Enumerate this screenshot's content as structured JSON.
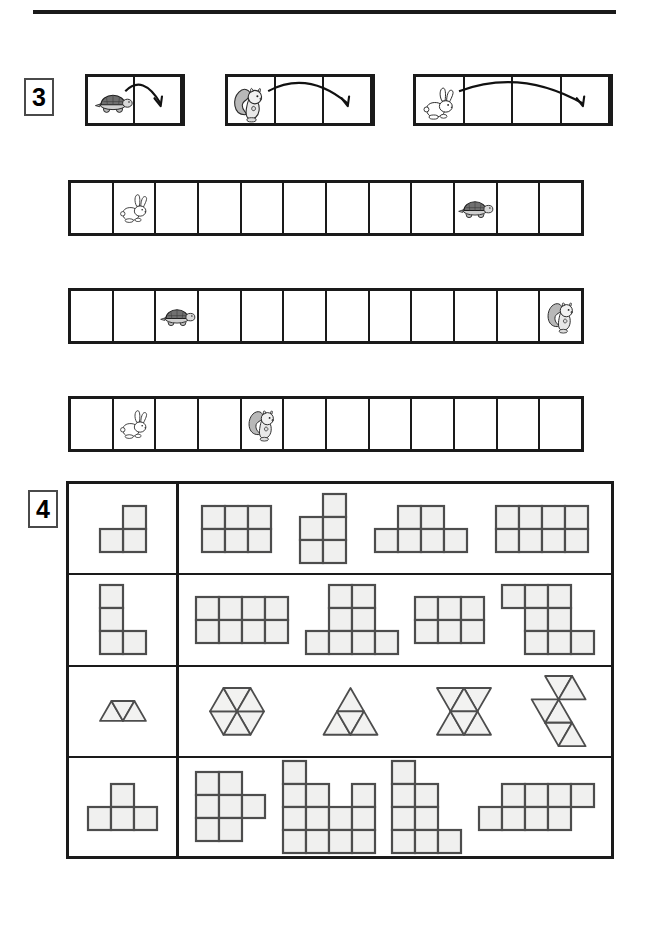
{
  "worksheet": {
    "title": "Math worksheet: animal jumps and polygon shapes",
    "top_rule": "horizontal-rule"
  },
  "task3": {
    "number": "3",
    "legend": [
      {
        "animal": "turtle",
        "cells": 2,
        "jump": 1,
        "arrow": "curved-arrow-right",
        "label": "turtle jumps 1 square"
      },
      {
        "animal": "squirrel",
        "cells": 3,
        "jump": 2,
        "arrow": "curved-arrow-right",
        "label": "squirrel jumps 2 squares"
      },
      {
        "animal": "rabbit",
        "cells": 4,
        "jump": 3,
        "arrow": "curved-arrow-right",
        "label": "rabbit jumps 3 squares"
      }
    ],
    "strips": [
      {
        "name": "strip-1",
        "cells": 12,
        "tokens": [
          {
            "animal": "rabbit",
            "cell": 2
          },
          {
            "animal": "turtle",
            "cell": 10
          }
        ]
      },
      {
        "name": "strip-2",
        "cells": 12,
        "tokens": [
          {
            "animal": "turtle",
            "cell": 3
          },
          {
            "animal": "squirrel",
            "cell": 12
          }
        ]
      },
      {
        "name": "strip-3",
        "cells": 12,
        "tokens": [
          {
            "animal": "rabbit",
            "cell": 2
          },
          {
            "animal": "squirrel",
            "cell": 5
          }
        ]
      }
    ]
  },
  "task4": {
    "number": "4",
    "cell_size": 23,
    "tri_size": 27,
    "rows": [
      {
        "name": "row-l-tromino",
        "kind": "square",
        "prototype": {
          "name": "l-tromino",
          "cells": [
            [
              1,
              0
            ],
            [
              1,
              1
            ],
            [
              0,
              1
            ]
          ]
        },
        "shapes": [
          {
            "name": "rect-3x2",
            "cells": [
              [
                0,
                0
              ],
              [
                1,
                0
              ],
              [
                2,
                0
              ],
              [
                0,
                1
              ],
              [
                1,
                1
              ],
              [
                2,
                1
              ]
            ]
          },
          {
            "name": "s-pentomino",
            "cells": [
              [
                1,
                0
              ],
              [
                0,
                1
              ],
              [
                1,
                1
              ],
              [
                0,
                2
              ],
              [
                1,
                2
              ]
            ]
          },
          {
            "name": "p-hexomino",
            "cells": [
              [
                1,
                0
              ],
              [
                2,
                0
              ],
              [
                0,
                1
              ],
              [
                1,
                1
              ],
              [
                2,
                1
              ],
              [
                3,
                1
              ]
            ]
          },
          {
            "name": "rect-4x2",
            "cells": [
              [
                0,
                0
              ],
              [
                1,
                0
              ],
              [
                2,
                0
              ],
              [
                3,
                0
              ],
              [
                0,
                1
              ],
              [
                1,
                1
              ],
              [
                2,
                1
              ],
              [
                3,
                1
              ]
            ]
          }
        ]
      },
      {
        "name": "row-l-tetromino",
        "kind": "square",
        "prototype": {
          "name": "l-tetromino",
          "cells": [
            [
              0,
              0
            ],
            [
              0,
              1
            ],
            [
              0,
              2
            ],
            [
              1,
              2
            ]
          ]
        },
        "shapes": [
          {
            "name": "rect-4x2",
            "cells": [
              [
                0,
                0
              ],
              [
                1,
                0
              ],
              [
                2,
                0
              ],
              [
                3,
                0
              ],
              [
                0,
                1
              ],
              [
                1,
                1
              ],
              [
                2,
                1
              ],
              [
                3,
                1
              ]
            ]
          },
          {
            "name": "t-heptomino",
            "cells": [
              [
                1,
                0
              ],
              [
                2,
                0
              ],
              [
                1,
                1
              ],
              [
                2,
                1
              ],
              [
                0,
                2
              ],
              [
                1,
                2
              ],
              [
                2,
                2
              ],
              [
                3,
                2
              ]
            ]
          },
          {
            "name": "rect-3x2",
            "cells": [
              [
                0,
                0
              ],
              [
                1,
                0
              ],
              [
                2,
                0
              ],
              [
                0,
                1
              ],
              [
                1,
                1
              ],
              [
                2,
                1
              ]
            ]
          },
          {
            "name": "z-octomino",
            "cells": [
              [
                0,
                0
              ],
              [
                1,
                0
              ],
              [
                2,
                0
              ],
              [
                1,
                1
              ],
              [
                2,
                1
              ],
              [
                1,
                2
              ],
              [
                2,
                2
              ],
              [
                3,
                2
              ]
            ]
          }
        ]
      },
      {
        "name": "row-triangles",
        "kind": "triangle",
        "prototype": {
          "name": "trapezoid-3-triangles",
          "figure": "trapezoid"
        },
        "shapes": [
          {
            "name": "hexagon-6-triangles",
            "figure": "hexagon"
          },
          {
            "name": "triangle-9-triangles",
            "figure": "big-triangle"
          },
          {
            "name": "hourglass-bowtie",
            "figure": "hourglass"
          },
          {
            "name": "zigzag-strip",
            "figure": "zigzag"
          }
        ]
      },
      {
        "name": "row-t-tetromino",
        "kind": "square",
        "prototype": {
          "name": "t-tetromino",
          "cells": [
            [
              1,
              0
            ],
            [
              0,
              1
            ],
            [
              1,
              1
            ],
            [
              2,
              1
            ]
          ]
        },
        "shapes": [
          {
            "name": "plus-hexomino",
            "cells": [
              [
                0,
                0
              ],
              [
                1,
                0
              ],
              [
                0,
                1
              ],
              [
                1,
                1
              ],
              [
                2,
                1
              ],
              [
                0,
                2
              ],
              [
                1,
                2
              ]
            ]
          },
          {
            "name": "u-shape-large",
            "cells": [
              [
                0,
                0
              ],
              [
                0,
                1
              ],
              [
                1,
                1
              ],
              [
                3,
                1
              ],
              [
                0,
                2
              ],
              [
                1,
                2
              ],
              [
                2,
                2
              ],
              [
                3,
                2
              ],
              [
                0,
                3
              ],
              [
                1,
                3
              ],
              [
                2,
                3
              ],
              [
                3,
                3
              ]
            ]
          },
          {
            "name": "staircase-shape",
            "cells": [
              [
                0,
                0
              ],
              [
                0,
                1
              ],
              [
                1,
                1
              ],
              [
                0,
                2
              ],
              [
                1,
                2
              ],
              [
                0,
                3
              ],
              [
                1,
                3
              ],
              [
                2,
                3
              ]
            ]
          },
          {
            "name": "offset-bars",
            "cells": [
              [
                1,
                0
              ],
              [
                2,
                0
              ],
              [
                3,
                0
              ],
              [
                4,
                0
              ],
              [
                0,
                1
              ],
              [
                1,
                1
              ],
              [
                2,
                1
              ],
              [
                3,
                1
              ]
            ]
          }
        ]
      }
    ]
  }
}
